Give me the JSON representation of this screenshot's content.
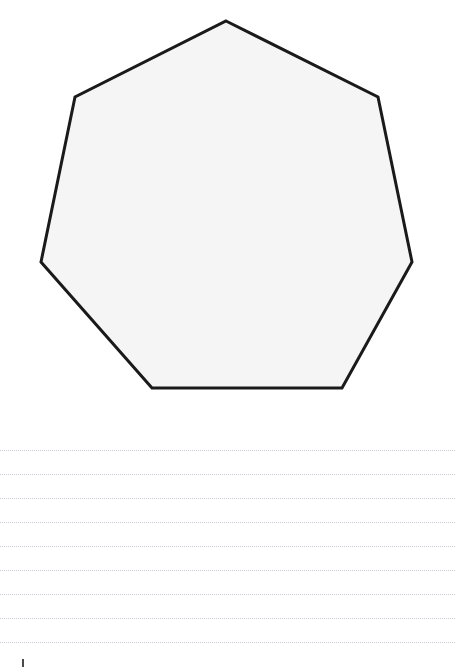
{
  "page": {
    "background_color": "#ffffff",
    "width": 455,
    "height": 667
  },
  "shape": {
    "name": "heptagon",
    "sides": 7,
    "label": "Heptagon",
    "fill_color": "#f5f5f6",
    "stroke_color": "#1a1a1a",
    "stroke_width": 3,
    "vertices": [
      [
        226,
        21
      ],
      [
        378,
        97
      ],
      [
        412,
        262
      ],
      [
        342,
        388
      ],
      [
        152,
        388
      ],
      [
        41,
        262
      ],
      [
        75,
        97
      ]
    ],
    "points_attr": "226,21 378,97 412,262 342,388 152,388 41,262 75,97"
  },
  "writing_lines": {
    "count": 9,
    "color": "#b9bcc4",
    "style": "dotted",
    "thickness": 1,
    "left": 0,
    "right": 455,
    "spacing": 24,
    "y_positions": [
      30,
      54,
      78,
      102,
      126,
      150,
      174,
      198,
      222
    ]
  },
  "corner_mark": {
    "name": "registration-mark",
    "color": "#4a4a4a",
    "x": 22,
    "y": 659,
    "width": 2,
    "height": 8
  }
}
